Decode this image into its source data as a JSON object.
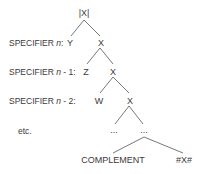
{
  "diagram": {
    "root": "|X|",
    "rows": [
      {
        "label_prefix": "SPECIFIER ",
        "label_var": "n",
        "label_suffix": ":",
        "spec": "Y",
        "head": "X"
      },
      {
        "label_prefix": "SPECIFIER ",
        "label_var": "n",
        "label_suffix": " - 1:",
        "spec": "Z",
        "head": "X"
      },
      {
        "label_prefix": "SPECIFIER ",
        "label_var": "n",
        "label_suffix": " - 2:",
        "spec": "W",
        "head": "X"
      }
    ],
    "etc_label": "etc.",
    "ellipsis_left": "...",
    "ellipsis_right": "...",
    "complement": "COMPLEMENT",
    "terminal": "#X#",
    "line_color": "#555555"
  }
}
